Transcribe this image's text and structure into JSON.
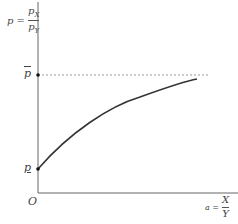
{
  "diagram": {
    "y_axis_label": {
      "lhs": "p =",
      "numerator": "p",
      "numerator_sub": "X",
      "denominator": "p",
      "denominator_sub": "Y"
    },
    "x_axis_label": {
      "lhs": "a =",
      "numerator": "X",
      "denominator": "Y"
    },
    "origin_label": "O",
    "upper_level_label": "p",
    "lower_level_label": "p",
    "curve": {
      "description": "concave increasing curve from lower level p (underlined) approaching upper level p (overlined) asymptotically",
      "points": [
        [
          38,
          169
        ],
        [
          88,
          125
        ],
        [
          138,
          100
        ],
        [
          197,
          79
        ]
      ]
    },
    "asymptote": {
      "style": "dashed",
      "y": 75
    }
  },
  "colors": {
    "axis": "#555555",
    "curve": "#333333",
    "dash": "#999999",
    "text": "#444444"
  }
}
